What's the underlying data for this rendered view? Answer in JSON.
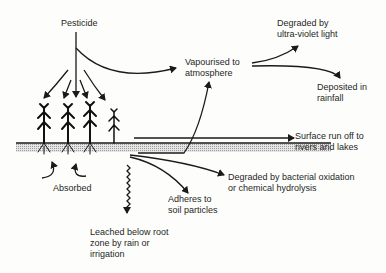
{
  "diagram": {
    "source": {
      "label": "Pesticide"
    },
    "nodes": {
      "vapourised": {
        "line1": "Vapourised to",
        "line2": "atmosphere"
      },
      "degraded_uv": {
        "line1": "Degraded by",
        "line2": "ultra-violet light"
      },
      "deposited": {
        "line1": "Deposited in",
        "line2": "rainfall"
      },
      "runoff": {
        "line1": "Surface run off to",
        "line2": "rivers and lakes"
      },
      "degraded_bact": {
        "line1": "Degraded by bacterial oxidation",
        "line2": "or chemical hydrolysis"
      },
      "adheres": {
        "line1": "Adheres to",
        "line2": "soil particles"
      },
      "absorbed": {
        "label": "Absorbed"
      },
      "leached": {
        "line1": "Leached below root",
        "line2": "zone by rain or",
        "line3": "irrigation"
      }
    },
    "colors": {
      "ink": "#1a1a1a",
      "soil": "#bdbdbd",
      "background": "#fdfdfb"
    }
  }
}
